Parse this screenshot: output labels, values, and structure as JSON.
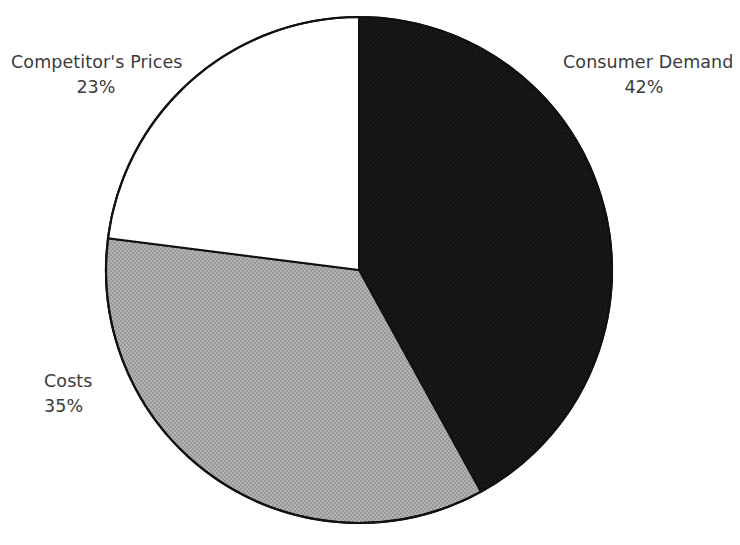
{
  "chart_data": {
    "type": "pie",
    "title": "",
    "subtitle": "",
    "xlabel": "",
    "ylabel": "",
    "legend_position": "none",
    "grid": false,
    "start_angle_deg": 0,
    "direction": "clockwise",
    "categories": [
      "Consumer Demand",
      "Costs",
      "Competitor's Prices"
    ],
    "values": [
      42,
      35,
      23
    ],
    "value_unit": "%",
    "slices": [
      {
        "label": "Consumer Demand",
        "value": 42,
        "value_text": "42%",
        "fill": "#151515",
        "stroke": "#111111",
        "start_deg": 0,
        "end_deg": 151.2
      },
      {
        "label": "Costs",
        "value": 35,
        "value_text": "35%",
        "fill": "#a9a9a9",
        "stroke": "#111111",
        "start_deg": 151.2,
        "end_deg": 277.2
      },
      {
        "label": "Competitor's Prices",
        "value": 23,
        "value_text": "23%",
        "fill": "#ffffff",
        "stroke": "#111111",
        "start_deg": 277.2,
        "end_deg": 360
      }
    ]
  },
  "labels": {
    "consumer": {
      "name": "Consumer Demand",
      "value": "42%"
    },
    "costs": {
      "name": "Costs",
      "value": "35%"
    },
    "competitor": {
      "name": "Competitor's Prices",
      "value": "23%"
    }
  },
  "colors": {
    "slice_dark": "#151515",
    "slice_gray": "#a9a9a9",
    "slice_white": "#ffffff",
    "outline": "#111111",
    "text": "#3b3b3b",
    "background": "#ffffff"
  },
  "geometry": {
    "center_x": 359,
    "center_y": 270,
    "radius": 253
  }
}
